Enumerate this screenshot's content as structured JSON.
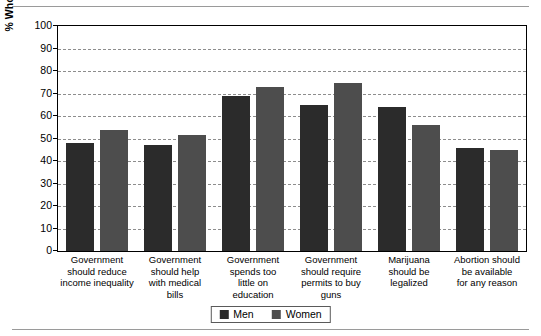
{
  "chart_data": {
    "type": "bar",
    "title": "",
    "xlabel": "",
    "ylabel": "% Who Agree with Survey Statement",
    "ylim": [
      0,
      100
    ],
    "ytick_step": 10,
    "yticks": [
      100,
      90,
      80,
      70,
      60,
      50,
      40,
      30,
      20,
      10,
      0
    ],
    "grid": true,
    "legend_position": "bottom-center",
    "categories": [
      "Government should reduce income inequality",
      "Government should help with medical bills",
      "Government spends too little on education",
      "Government should require permits to buy guns",
      "Marijuana should be legalized",
      "Abortion should be available for any reason"
    ],
    "category_lines": [
      [
        "Government",
        "should reduce",
        "income inequality"
      ],
      [
        "Government",
        "should help",
        "with medical",
        "bills"
      ],
      [
        "Government",
        "spends too",
        "little on",
        "education"
      ],
      [
        "Government",
        "should require",
        "permits to buy",
        "guns"
      ],
      [
        "Marijuana",
        "should be",
        "legalized"
      ],
      [
        "Abortion should",
        "be available",
        "for any reason"
      ]
    ],
    "series": [
      {
        "name": "Men",
        "color": "#2b2b2b",
        "values": [
          48,
          47,
          69,
          65,
          64,
          46
        ]
      },
      {
        "name": "Women",
        "color": "#4d4d4d",
        "values": [
          54,
          51.5,
          73,
          74.5,
          56,
          45
        ]
      }
    ]
  },
  "legend": {
    "items": [
      {
        "label": "Men",
        "color": "#2b2b2b"
      },
      {
        "label": "Women",
        "color": "#4d4d4d"
      }
    ]
  }
}
